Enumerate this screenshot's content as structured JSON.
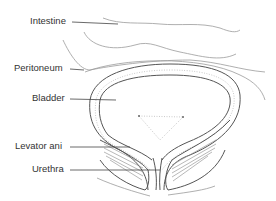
{
  "diagram": {
    "labels": [
      {
        "id": "intestine",
        "text": "Intestine"
      },
      {
        "id": "peritoneum",
        "text": "Peritoneum"
      },
      {
        "id": "bladder",
        "text": "Bladder"
      },
      {
        "id": "levator-ani",
        "text": "Levator ani"
      },
      {
        "id": "urethra",
        "text": "Urethra"
      }
    ],
    "colors": {
      "line": "#555555",
      "text": "#333333",
      "background": "#ffffff"
    }
  }
}
